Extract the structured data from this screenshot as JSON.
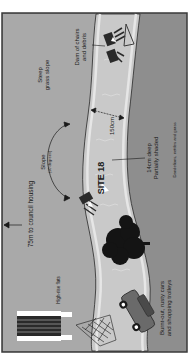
{
  "diagram": {
    "title": "SITE 18",
    "orientation": "rotated 90° counter-clockwise",
    "colors": {
      "frame": "#3a3a3a",
      "left_bank": "#a9a9a9",
      "right_bank": "#8e8e8e",
      "river": "#c9c9c9",
      "river_edge": "#e6e6e6",
      "ink": "#1a1a1a"
    },
    "labels": {
      "site": "SITE 18",
      "width": "150cm",
      "depth_line1": "14cm deep",
      "depth_line2": "Partially shaded",
      "vegetation": "Dandelions, nettles and grass",
      "steep_line1": "Steep",
      "steep_line2": "grass slope",
      "dam_line1": "Dam of chairs",
      "dam_line2": "and debris",
      "slope_line1": "Slope",
      "slope_line2": "(10 degrees)",
      "housing": "75m to council housing",
      "flats": "High-rise flats",
      "cars_line1": "Burnt-out, rusty cars",
      "cars_line2": "and shopping trolleys"
    },
    "icons": [
      "dam-chairs-icon",
      "chair-icon",
      "tree-icon",
      "car-icon",
      "shopping-trolley-icon",
      "high-rise-flats-icon",
      "flow-arrow-icon"
    ]
  }
}
